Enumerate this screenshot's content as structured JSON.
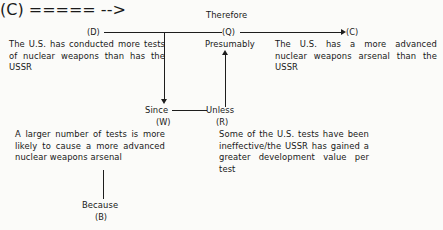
{
  "diagram": {
    "type": "toulmin-argument-model",
    "title_connector": "Therefore",
    "nodes": {
      "D": {
        "tag": "(D)",
        "text": "The U.S. has conducted more tests of nuclear weapons than has the USSR"
      },
      "Q": {
        "tag": "(Q)",
        "text": "Presumably"
      },
      "C": {
        "tag": "(C)",
        "text": "The U.S. has a more advanced nuclear weapons arsenal than the USSR"
      },
      "W": {
        "tag": "(W)",
        "connector": "Since",
        "text": "A larger number of tests is more likely to cause a more advanced nuclear weapons arsenal"
      },
      "R": {
        "tag": "(R)",
        "connector": "Unless",
        "text": "Some of the U.S. tests have been ineffective/the USSR has gained a greater development value per test"
      },
      "B": {
        "tag": "(B)",
        "connector": "Because"
      }
    },
    "edges": [
      {
        "from": "D",
        "to": "C",
        "style": "arrow-right"
      },
      {
        "from": "D",
        "to": "W",
        "style": "arrow-down"
      },
      {
        "from": "W",
        "to": "R",
        "style": "plain-line"
      },
      {
        "from": "R",
        "to": "Q",
        "style": "arrow-up"
      },
      {
        "from": "W",
        "to": "B",
        "style": "plain-line"
      }
    ],
    "colors": {
      "ink": "#1d1d1d",
      "background": "#fbfbf9"
    }
  }
}
